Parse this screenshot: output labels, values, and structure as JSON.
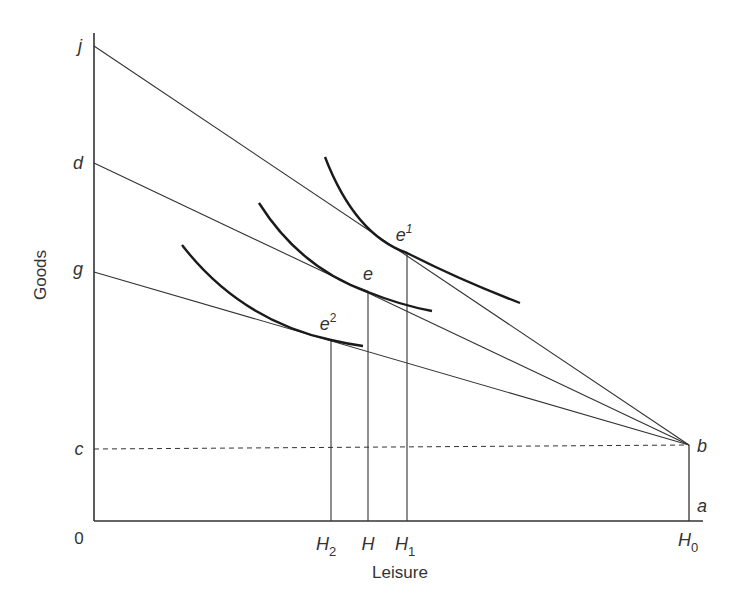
{
  "diagram": {
    "type": "labor-leisure budget constraint with indifference curves",
    "axes": {
      "x_label": "Leisure",
      "y_label": "Goods",
      "origin_label": "0"
    },
    "y_tick_labels": {
      "j": "j",
      "d": "d",
      "g": "g",
      "c": "c"
    },
    "x_tick_labels": {
      "H2": "H",
      "H2_sub": "2",
      "H": "H",
      "H1": "H",
      "H1_sub": "1",
      "H0": "H",
      "H0_sub": "0"
    },
    "point_labels": {
      "b": "b",
      "a": "a",
      "e": "e",
      "e1": "e",
      "e1_sup": "1",
      "e2": "e",
      "e2_sup": "2"
    },
    "budget_lines": [
      {
        "name": "jb",
        "from": "j",
        "to": "b"
      },
      {
        "name": "db",
        "from": "d",
        "to": "b"
      },
      {
        "name": "gb",
        "from": "g",
        "to": "b"
      }
    ],
    "indifference_curves": [
      {
        "name": "upper",
        "tangent_point": "e1",
        "tangent_line": "jb"
      },
      {
        "name": "middle",
        "tangent_point": "e",
        "tangent_line": "db"
      },
      {
        "name": "lower",
        "tangent_point": "e2",
        "tangent_line": "gb"
      }
    ],
    "dashed_line": {
      "from": "c",
      "to": "b"
    },
    "colors": {
      "lines": "#333333",
      "curves": "#1a1a1a",
      "text": "#333333"
    }
  }
}
